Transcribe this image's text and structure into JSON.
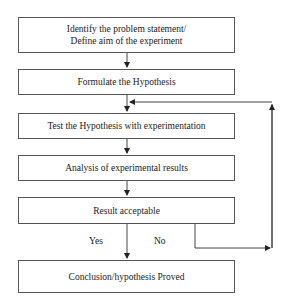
{
  "diagram": {
    "type": "flowchart",
    "steps": [
      {
        "id": "s1",
        "line1": "Identify the problem statement/",
        "line2": "Define aim of the experiment"
      },
      {
        "id": "s2",
        "label": "Formulate the Hypothesis"
      },
      {
        "id": "s3",
        "label": "Test the Hypothesis with experimentation"
      },
      {
        "id": "s4",
        "label": "Analysis of experimental results"
      },
      {
        "id": "s5",
        "label": "Result acceptable"
      },
      {
        "id": "s6",
        "label": "Conclusion/hypothesis Proved"
      }
    ],
    "branches": {
      "yes": "Yes",
      "no": "No"
    },
    "edges": [
      [
        "s1",
        "s2"
      ],
      [
        "s2",
        "s3"
      ],
      [
        "s3",
        "s4"
      ],
      [
        "s4",
        "s5"
      ],
      [
        "s5",
        "s6",
        "Yes"
      ],
      [
        "s5",
        "s3",
        "No"
      ]
    ],
    "colors": {
      "line": "#444444",
      "box_border": "#555555",
      "background": "#ffffff"
    }
  }
}
